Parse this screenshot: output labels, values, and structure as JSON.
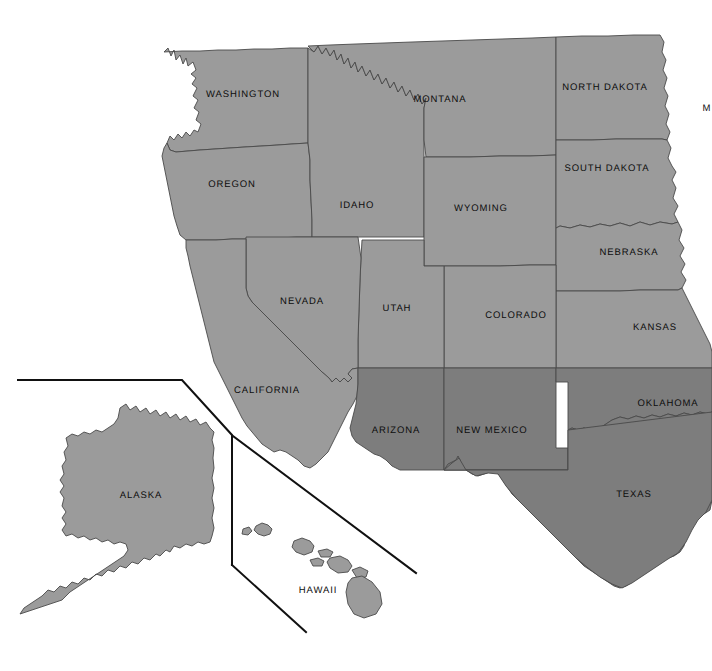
{
  "map": {
    "title": "United States map — western states",
    "background_color": "#ffffff",
    "border_color": "#4a4a4a",
    "inset_line_color": "#111111",
    "label_color": "#0d0d0d",
    "fills": {
      "light": "#9b9b9b",
      "dark": "#7d7d7d"
    },
    "legend_groups": [
      {
        "name": "light-gray-states",
        "color": "#9b9b9b"
      },
      {
        "name": "dark-gray-states",
        "color": "#7d7d7d"
      }
    ],
    "labels": [
      {
        "id": "washington",
        "text": "WASHINGTON",
        "x": 243,
        "y": 94,
        "shade": "light"
      },
      {
        "id": "oregon",
        "text": "OREGON",
        "x": 232,
        "y": 184,
        "shade": "light"
      },
      {
        "id": "idaho",
        "text": "IDAHO",
        "x": 357,
        "y": 205,
        "shade": "light"
      },
      {
        "id": "montana",
        "text": "MONTANA",
        "x": 440,
        "y": 99,
        "shade": "light"
      },
      {
        "id": "wyoming",
        "text": "WYOMING",
        "x": 481,
        "y": 208,
        "shade": "light"
      },
      {
        "id": "north-dakota",
        "text": "NORTH DAKOTA",
        "x": 605,
        "y": 87,
        "shade": "light"
      },
      {
        "id": "south-dakota",
        "text": "SOUTH DAKOTA",
        "x": 607,
        "y": 168,
        "shade": "light"
      },
      {
        "id": "nebraska",
        "text": "NEBRASKA",
        "x": 629,
        "y": 252,
        "shade": "light"
      },
      {
        "id": "kansas",
        "text": "KANSAS",
        "x": 655,
        "y": 327,
        "shade": "light"
      },
      {
        "id": "minnesota",
        "text": "M",
        "x": 707,
        "y": 108,
        "shade": "light"
      },
      {
        "id": "nevada",
        "text": "NEVADA",
        "x": 302,
        "y": 301,
        "shade": "light"
      },
      {
        "id": "utah",
        "text": "UTAH",
        "x": 397,
        "y": 308,
        "shade": "light"
      },
      {
        "id": "colorado",
        "text": "COLORADO",
        "x": 516,
        "y": 315,
        "shade": "light"
      },
      {
        "id": "california",
        "text": "CALIFORNIA",
        "x": 267,
        "y": 390,
        "shade": "light"
      },
      {
        "id": "arizona",
        "text": "ARIZONA",
        "x": 396,
        "y": 430,
        "shade": "dark"
      },
      {
        "id": "new-mexico",
        "text": "NEW MEXICO",
        "x": 492,
        "y": 430,
        "shade": "dark"
      },
      {
        "id": "oklahoma",
        "text": "OKLAHOMA",
        "x": 668,
        "y": 403,
        "shade": "dark"
      },
      {
        "id": "texas",
        "text": "TEXAS",
        "x": 634,
        "y": 494,
        "shade": "dark"
      },
      {
        "id": "alaska",
        "text": "ALASKA",
        "x": 141,
        "y": 495,
        "shade": "light"
      },
      {
        "id": "hawaii",
        "text": "HAWAII",
        "x": 318,
        "y": 590,
        "shade": "light"
      }
    ]
  }
}
